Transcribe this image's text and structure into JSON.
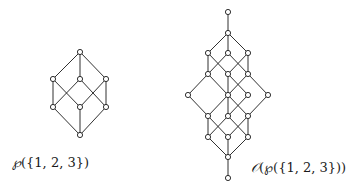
{
  "diagrams": [
    {
      "id": "powerset",
      "label_prefix": "℘",
      "label_rest": "({1, 2, 3})",
      "label_full": "℘({1, 2, 3})",
      "nodes": [
        {
          "id": "a0",
          "x": 80,
          "y": 135
        },
        {
          "id": "a1",
          "x": 53,
          "y": 107
        },
        {
          "id": "a2",
          "x": 80,
          "y": 107
        },
        {
          "id": "a3",
          "x": 106,
          "y": 107
        },
        {
          "id": "a4",
          "x": 53,
          "y": 79
        },
        {
          "id": "a5",
          "x": 80,
          "y": 79
        },
        {
          "id": "a6",
          "x": 106,
          "y": 79
        },
        {
          "id": "a7",
          "x": 80,
          "y": 52
        }
      ],
      "edges": [
        [
          "a0",
          "a1"
        ],
        [
          "a0",
          "a2"
        ],
        [
          "a0",
          "a3"
        ],
        [
          "a1",
          "a4"
        ],
        [
          "a1",
          "a5"
        ],
        [
          "a2",
          "a4"
        ],
        [
          "a2",
          "a6"
        ],
        [
          "a3",
          "a5"
        ],
        [
          "a3",
          "a6"
        ],
        [
          "a4",
          "a7"
        ],
        [
          "a5",
          "a7"
        ],
        [
          "a6",
          "a7"
        ]
      ]
    },
    {
      "id": "downsets",
      "label_prefix": "𝒪",
      "label_rest": "(℘({1, 2, 3}))",
      "label_full": "𝒪(℘({1, 2, 3}))",
      "nodes": [
        {
          "id": "b0",
          "x": 228,
          "y": 178
        },
        {
          "id": "b1",
          "x": 228,
          "y": 157
        },
        {
          "id": "b2",
          "x": 208,
          "y": 137
        },
        {
          "id": "b3",
          "x": 228,
          "y": 137
        },
        {
          "id": "b4",
          "x": 248,
          "y": 137
        },
        {
          "id": "b5",
          "x": 208,
          "y": 116
        },
        {
          "id": "b6",
          "x": 228,
          "y": 116
        },
        {
          "id": "b7",
          "x": 248,
          "y": 116
        },
        {
          "id": "b8",
          "x": 188,
          "y": 95
        },
        {
          "id": "b9",
          "x": 228,
          "y": 95
        },
        {
          "id": "b10",
          "x": 248,
          "y": 95
        },
        {
          "id": "b11",
          "x": 268,
          "y": 95
        },
        {
          "id": "b12",
          "x": 208,
          "y": 74
        },
        {
          "id": "b13",
          "x": 228,
          "y": 74
        },
        {
          "id": "b14",
          "x": 248,
          "y": 74
        },
        {
          "id": "b15",
          "x": 208,
          "y": 53
        },
        {
          "id": "b16",
          "x": 228,
          "y": 53
        },
        {
          "id": "b17",
          "x": 248,
          "y": 53
        },
        {
          "id": "b18",
          "x": 228,
          "y": 33
        },
        {
          "id": "b19",
          "x": 228,
          "y": 12
        }
      ],
      "edges": [
        [
          "b0",
          "b1"
        ],
        [
          "b1",
          "b2"
        ],
        [
          "b1",
          "b3"
        ],
        [
          "b1",
          "b4"
        ],
        [
          "b2",
          "b5"
        ],
        [
          "b2",
          "b6"
        ],
        [
          "b3",
          "b5"
        ],
        [
          "b3",
          "b7"
        ],
        [
          "b4",
          "b6"
        ],
        [
          "b4",
          "b7"
        ],
        [
          "b5",
          "b8"
        ],
        [
          "b5",
          "b9"
        ],
        [
          "b6",
          "b9"
        ],
        [
          "b6",
          "b10"
        ],
        [
          "b7",
          "b9"
        ],
        [
          "b7",
          "b11"
        ],
        [
          "b8",
          "b12"
        ],
        [
          "b9",
          "b12"
        ],
        [
          "b9",
          "b13"
        ],
        [
          "b9",
          "b14"
        ],
        [
          "b10",
          "b13"
        ],
        [
          "b11",
          "b14"
        ],
        [
          "b12",
          "b15"
        ],
        [
          "b12",
          "b16"
        ],
        [
          "b13",
          "b15"
        ],
        [
          "b13",
          "b17"
        ],
        [
          "b14",
          "b16"
        ],
        [
          "b14",
          "b17"
        ],
        [
          "b15",
          "b18"
        ],
        [
          "b16",
          "b18"
        ],
        [
          "b17",
          "b18"
        ],
        [
          "b18",
          "b19"
        ]
      ]
    }
  ],
  "labels": {
    "left": {
      "prefix": "℘",
      "rest": "({1, 2, 3})",
      "x": 12,
      "y": 162
    },
    "right": {
      "prefix": "𝒪",
      "rest": "(℘({1, 2, 3}))",
      "x": 252,
      "y": 167
    }
  }
}
